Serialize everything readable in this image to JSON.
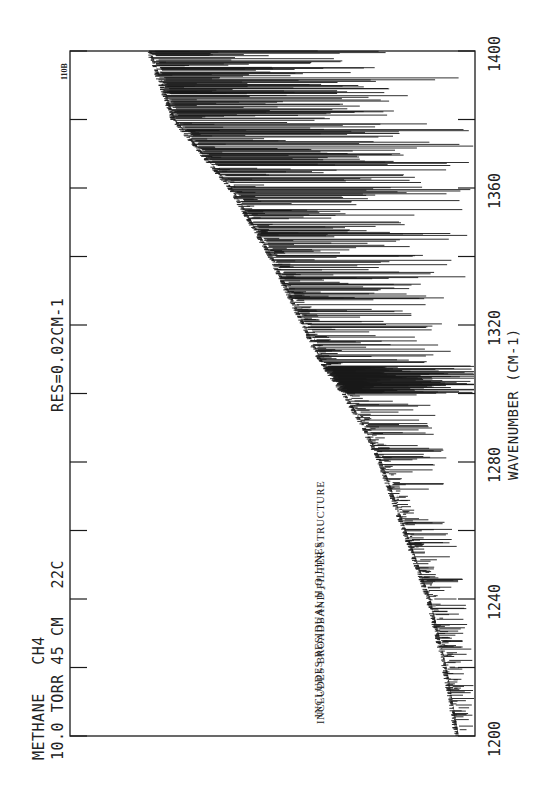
{
  "header": {
    "line1": "METHANE   CH4",
    "line2": "10.0 TORR 45 CM   22C",
    "resolution": "RES=0.02CM-1"
  },
  "plate_id": "110B",
  "annotations": {
    "line1_pre": "INCLUDES RESIDUAL H",
    "line1_sub": "2",
    "line1_post": "O LINES",
    "line2": "INCLUDES BROADBAND FILTER STRUCTURE"
  },
  "axis": {
    "x_title": "WAVENUMBER (CM-1)",
    "ticks": [
      "1200",
      "1240",
      "1280",
      "1320",
      "1360",
      "1400"
    ]
  },
  "colors": {
    "ink": "#1a1a1a",
    "paper": "#ffffff"
  },
  "chart_data": {
    "type": "line",
    "subtitle": "RES=0.02CM-1",
    "xlabel": "WAVENUMBER (CM-1)",
    "ylabel": "",
    "xlim": [
      1200,
      1400
    ],
    "x_ticks": [
      1200,
      1220,
      1240,
      1260,
      1280,
      1300,
      1320,
      1340,
      1360,
      1380,
      1400
    ],
    "x_tick_labels": [
      "1200",
      "1240",
      "1280",
      "1320",
      "1360",
      "1400"
    ],
    "orientation": "rotated 90deg: wavenumber increases bottom-to-top along right edge; absorption lines extend toward right axis",
    "grid": false,
    "legend": null,
    "annotations": [
      "INCLUDES RESIDUAL H2O LINES",
      "INCLUDES BROADBAND FILTER STRUCTURE",
      "110B"
    ],
    "baseline_envelope": {
      "x": [
        1200,
        1220,
        1240,
        1260,
        1280,
        1290,
        1300,
        1310,
        1320,
        1340,
        1360,
        1380,
        1400
      ],
      "relative_level": [
        0.96,
        0.93,
        0.89,
        0.83,
        0.77,
        0.73,
        0.68,
        0.62,
        0.58,
        0.5,
        0.4,
        0.26,
        0.2
      ]
    },
    "strong_line_regions": [
      {
        "x_range": [
          1300,
          1308
        ],
        "note": "dense Q-branch cluster of saturated lines"
      },
      {
        "x_range": [
          1310,
          1395
        ],
        "note": "P/R-branch strong lines reaching near full absorption"
      },
      {
        "x_range": [
          1200,
          1300
        ],
        "note": "weaker lines, intensity increasing toward 1300"
      }
    ]
  }
}
